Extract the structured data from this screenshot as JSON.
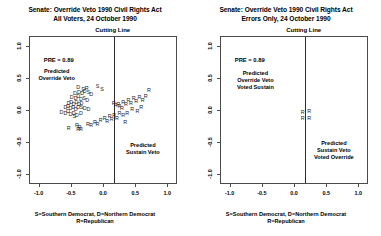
{
  "chart_data": [
    {
      "type": "scatter",
      "panel": "left",
      "title_line1": "Senate: Override Veto 1990 Civil Rights Act",
      "title_line2": "All Voters, 24 October 1990",
      "xlabel": "",
      "ylabel": "",
      "xlim": [
        -1.15,
        1.15
      ],
      "ylim": [
        -1.15,
        1.15
      ],
      "xticks": [
        "-1.0",
        "-0.5",
        "0.0",
        "0.5",
        "1.0"
      ],
      "xtick_values": [
        -1.0,
        -0.5,
        0.0,
        0.5,
        1.0
      ],
      "yticks": [
        "1.0",
        "0.5",
        "0.0",
        "-0.5",
        "-1.0"
      ],
      "ytick_values": [
        1.0,
        0.5,
        0.0,
        -0.5,
        -1.0
      ],
      "grid": false,
      "legend": "none",
      "cutting_line_x": 0.15,
      "cutting_line_label": "Cutting Line",
      "pre_label": "PRE = 0.89",
      "annotations": [
        {
          "text_lines": [
            "Predicted",
            "Override Veto"
          ],
          "x": -0.72,
          "y": 0.66
        },
        {
          "text_lines": [
            "Predicted",
            "Sustain Veto"
          ],
          "x": 0.62,
          "y": -0.49
        }
      ],
      "points": [
        {
          "label": "D",
          "x": -0.4,
          "y": 0.36
        },
        {
          "label": "D",
          "x": -0.32,
          "y": 0.33
        },
        {
          "label": "R",
          "x": -0.27,
          "y": 0.34
        },
        {
          "label": "S",
          "x": -0.1,
          "y": 0.38
        },
        {
          "label": "S",
          "x": -0.03,
          "y": 0.33
        },
        {
          "label": "D",
          "x": -0.45,
          "y": 0.27
        },
        {
          "label": "D",
          "x": -0.39,
          "y": 0.28
        },
        {
          "label": "D",
          "x": -0.34,
          "y": 0.27
        },
        {
          "label": "D",
          "x": -0.3,
          "y": 0.29
        },
        {
          "label": "S",
          "x": -0.24,
          "y": 0.28
        },
        {
          "label": "D",
          "x": -0.2,
          "y": 0.25
        },
        {
          "label": "D",
          "x": -0.5,
          "y": 0.2
        },
        {
          "label": "D",
          "x": -0.44,
          "y": 0.19
        },
        {
          "label": "D",
          "x": -0.4,
          "y": 0.21
        },
        {
          "label": "D",
          "x": -0.36,
          "y": 0.17
        },
        {
          "label": "S",
          "x": -0.31,
          "y": 0.19
        },
        {
          "label": "D",
          "x": -0.26,
          "y": 0.16
        },
        {
          "label": "D",
          "x": -0.55,
          "y": 0.11
        },
        {
          "label": "D",
          "x": -0.51,
          "y": 0.13
        },
        {
          "label": "D",
          "x": -0.47,
          "y": 0.1
        },
        {
          "label": "D",
          "x": -0.43,
          "y": 0.12
        },
        {
          "label": "D",
          "x": -0.39,
          "y": 0.09
        },
        {
          "label": "D",
          "x": -0.35,
          "y": 0.11
        },
        {
          "label": "D",
          "x": -0.6,
          "y": 0.04
        },
        {
          "label": "D",
          "x": -0.56,
          "y": 0.06
        },
        {
          "label": "D",
          "x": -0.52,
          "y": 0.03
        },
        {
          "label": "D",
          "x": -0.48,
          "y": 0.05
        },
        {
          "label": "D",
          "x": -0.44,
          "y": 0.02
        },
        {
          "label": "D",
          "x": -0.4,
          "y": 0.04
        },
        {
          "label": "S",
          "x": -0.35,
          "y": 0.05
        },
        {
          "label": "D",
          "x": -0.3,
          "y": 0.03
        },
        {
          "label": "D",
          "x": -0.24,
          "y": 0.01
        },
        {
          "label": "D",
          "x": -0.66,
          "y": -0.03
        },
        {
          "label": "D",
          "x": -0.6,
          "y": -0.05
        },
        {
          "label": "D",
          "x": -0.56,
          "y": -0.02
        },
        {
          "label": "D",
          "x": -0.52,
          "y": -0.06
        },
        {
          "label": "D",
          "x": -0.47,
          "y": -0.04
        },
        {
          "label": "D",
          "x": -0.42,
          "y": -0.07
        },
        {
          "label": "D",
          "x": -0.36,
          "y": -0.05
        },
        {
          "label": "S",
          "x": -0.46,
          "y": -0.09
        },
        {
          "label": "R",
          "x": -0.42,
          "y": -0.23
        },
        {
          "label": "R",
          "x": -0.38,
          "y": -0.26
        },
        {
          "label": "R",
          "x": -0.55,
          "y": -0.28
        },
        {
          "label": "R",
          "x": -0.4,
          "y": -0.3
        },
        {
          "label": "R",
          "x": -0.36,
          "y": -0.29
        },
        {
          "label": "R",
          "x": -0.25,
          "y": -0.21
        },
        {
          "label": "R",
          "x": -0.2,
          "y": -0.24
        },
        {
          "label": "R",
          "x": -0.14,
          "y": -0.18
        },
        {
          "label": "R",
          "x": -0.1,
          "y": -0.22
        },
        {
          "label": "R",
          "x": -0.05,
          "y": -0.15
        },
        {
          "label": "R",
          "x": 0.01,
          "y": -0.12
        },
        {
          "label": "R",
          "x": 0.05,
          "y": -0.17
        },
        {
          "label": "R",
          "x": 0.09,
          "y": -0.1
        },
        {
          "label": "R",
          "x": 0.12,
          "y": -0.14
        },
        {
          "label": "R",
          "x": 0.16,
          "y": -0.08
        },
        {
          "label": "R",
          "x": 0.2,
          "y": -0.13
        },
        {
          "label": "R",
          "x": 0.24,
          "y": 0.06
        },
        {
          "label": "R",
          "x": 0.28,
          "y": 0.03
        },
        {
          "label": "R",
          "x": 0.22,
          "y": 0.1
        },
        {
          "label": "R",
          "x": 0.18,
          "y": 0.07
        },
        {
          "label": "R",
          "x": 0.15,
          "y": 0.11
        },
        {
          "label": "R",
          "x": 0.3,
          "y": 0.13
        },
        {
          "label": "R",
          "x": 0.34,
          "y": 0.09
        },
        {
          "label": "R",
          "x": 0.38,
          "y": 0.15
        },
        {
          "label": "R",
          "x": 0.42,
          "y": 0.11
        },
        {
          "label": "R",
          "x": 0.46,
          "y": 0.18
        },
        {
          "label": "R",
          "x": 0.5,
          "y": 0.14
        },
        {
          "label": "R",
          "x": 0.55,
          "y": 0.2
        },
        {
          "label": "R",
          "x": 0.6,
          "y": 0.16
        },
        {
          "label": "R",
          "x": 0.65,
          "y": 0.22
        },
        {
          "label": "R",
          "x": 0.7,
          "y": 0.31
        },
        {
          "label": "R",
          "x": 0.58,
          "y": 0.05
        },
        {
          "label": "R",
          "x": 0.52,
          "y": -0.02
        },
        {
          "label": "R",
          "x": 0.44,
          "y": 0.02
        },
        {
          "label": "R",
          "x": 0.36,
          "y": -0.05
        },
        {
          "label": "R",
          "x": 0.3,
          "y": -0.08
        },
        {
          "label": "R",
          "x": 0.24,
          "y": -0.04
        },
        {
          "label": "R",
          "x": 0.33,
          "y": -0.19
        }
      ]
    },
    {
      "type": "scatter",
      "panel": "right",
      "title_line1": "Senate: Override Veto 1990 Civil Rights Act",
      "title_line2": "Errors Only, 24 October 1990",
      "xlabel": "",
      "ylabel": "",
      "xlim": [
        -1.15,
        1.15
      ],
      "ylim": [
        -1.15,
        1.15
      ],
      "xticks": [
        "-1.0",
        "-0.5",
        "0.0",
        "0.5",
        "1.0"
      ],
      "xtick_values": [
        -1.0,
        -0.5,
        0.0,
        0.5,
        1.0
      ],
      "yticks": [
        "1.0",
        "0.5",
        "0.0",
        "-0.5",
        "-1.0"
      ],
      "ytick_values": [
        1.0,
        0.5,
        0.0,
        -0.5,
        -1.0
      ],
      "grid": false,
      "legend": "none",
      "cutting_line_x": 0.15,
      "cutting_line_label": "Cutting Line",
      "pre_label": "PRE = 0.89",
      "annotations": [
        {
          "text_lines": [
            "Predicted",
            "Override Veto",
            "Voted Sustain"
          ],
          "x": -0.6,
          "y": 0.62
        },
        {
          "text_lines": [
            "Predicted",
            "Sustain Veto",
            "Voted Override"
          ],
          "x": 0.62,
          "y": -0.46
        }
      ],
      "points": [
        {
          "label": "R",
          "x": 0.12,
          "y": -0.03
        },
        {
          "label": "R",
          "x": 0.22,
          "y": -0.02
        },
        {
          "label": "R",
          "x": 0.12,
          "y": -0.12
        },
        {
          "label": "R",
          "x": 0.22,
          "y": -0.12
        }
      ]
    }
  ],
  "caption": {
    "line1": "S=Southern Democrat, D=Northern Democrat",
    "line2": "R=Republican"
  }
}
